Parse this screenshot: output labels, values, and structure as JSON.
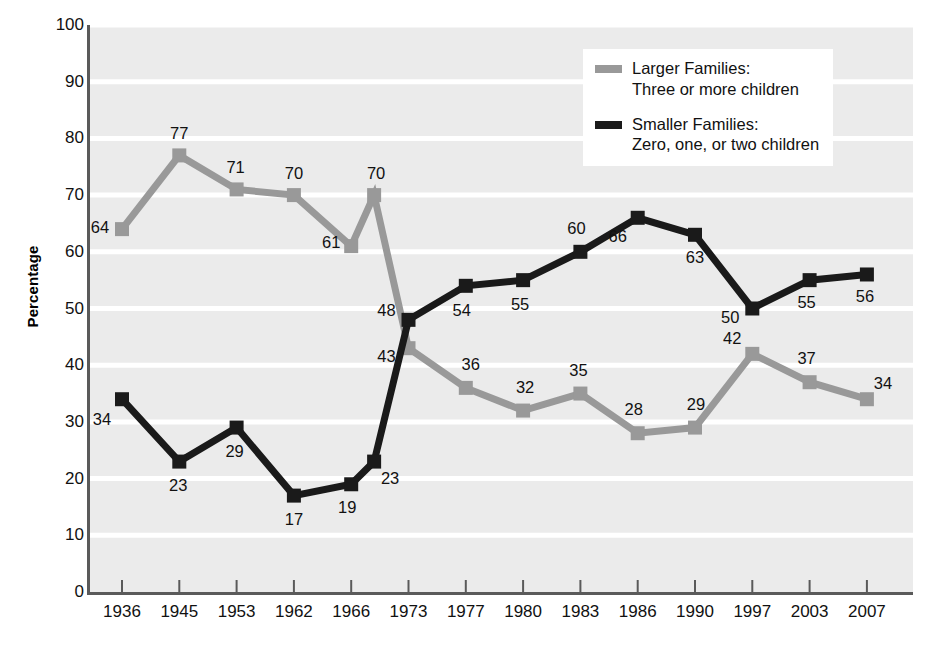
{
  "chart_data": {
    "type": "line",
    "title": "",
    "xlabel": "",
    "ylabel": "Percentage",
    "ylim": [
      0,
      100
    ],
    "ytick_step": 10,
    "grid": true,
    "grid_color": "#ffffff",
    "plot_background": "#ebebeb",
    "legend_position": "top-right",
    "categories": [
      "1936",
      "1945",
      "1953",
      "1962",
      "1966",
      "",
      "1973",
      "1977",
      "1980",
      "1983",
      "1986",
      "1990",
      "1997",
      "2003",
      "2007"
    ],
    "x_tick_labels": [
      "1936",
      "1945",
      "1953",
      "1962",
      "1966",
      "1973",
      "1977",
      "1980",
      "1983",
      "1986",
      "1990",
      "1997",
      "2003",
      "2007"
    ],
    "y_tick_labels": [
      "100",
      "90",
      "80",
      "70",
      "60",
      "50",
      "40",
      "30",
      "20",
      "10",
      "0"
    ],
    "series": [
      {
        "name": "Larger Families",
        "color": "#999999",
        "values": [
          64,
          77,
          71,
          70,
          61,
          70,
          43,
          36,
          32,
          35,
          28,
          29,
          42,
          37,
          34
        ],
        "labels": [
          "64",
          "77",
          "71",
          "70",
          "61",
          "70",
          "43",
          "36",
          "32",
          "35",
          "28",
          "29",
          "42",
          "37",
          "34"
        ]
      },
      {
        "name": "Smaller Families",
        "color": "#1a1a1a",
        "values": [
          34,
          23,
          29,
          17,
          19,
          23,
          48,
          54,
          55,
          60,
          66,
          63,
          50,
          55,
          56
        ],
        "labels": [
          "34",
          "23",
          "29",
          "17",
          "19",
          "23",
          "48",
          "54",
          "55",
          "60",
          "66",
          "63",
          "50",
          "55",
          "56"
        ]
      }
    ]
  },
  "legend": {
    "items": [
      {
        "swatch_color": "#999999",
        "label": "Larger Families:\nThree or more children"
      },
      {
        "swatch_color": "#1a1a1a",
        "label": "Smaller Families:\nZero, one, or two children"
      }
    ]
  },
  "axes": {
    "y_title": "Percentage"
  }
}
